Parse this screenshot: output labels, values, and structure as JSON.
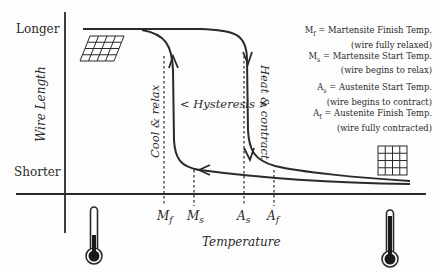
{
  "diagram": {
    "type": "hysteresis-curve",
    "y_axis": {
      "label": "Wire Length",
      "top_label": "Longer",
      "bottom_label": "Shorter"
    },
    "x_axis": {
      "label": "Temperature",
      "ticks": [
        {
          "symbol": "M",
          "sub": "f",
          "name": "Mf"
        },
        {
          "symbol": "M",
          "sub": "s",
          "name": "Ms"
        },
        {
          "symbol": "A",
          "sub": "s",
          "name": "As"
        },
        {
          "symbol": "A",
          "sub": "f",
          "name": "Af"
        }
      ]
    },
    "annotations": {
      "hysteresis": "< Hysteresis >",
      "cooling": "Cool & relax",
      "heating": "Heat & contract"
    },
    "legend": [
      {
        "symbol": "M",
        "sub": "f",
        "text": " = Martensite Finish Temp.",
        "note": "(wire fully relaxed)"
      },
      {
        "symbol": "M",
        "sub": "s",
        "text": " = Martensite Start Temp.",
        "note": "(wire begins to relax)"
      },
      {
        "symbol": "A",
        "sub": "s",
        "text": " = Austenite Start Temp.",
        "note": "(wire begins to contract)"
      },
      {
        "symbol": "A",
        "sub": "f",
        "text": " = Austenite Finish Temp.",
        "note": "(wire fully contracted)"
      }
    ],
    "icons": {
      "long_grid": "skewed-grid-icon",
      "short_grid": "square-grid-icon",
      "cold": "thermometer-low-icon",
      "hot": "thermometer-high-icon"
    },
    "colors": {
      "ink": "#2a2a2a",
      "background": "#fdfdfd"
    }
  }
}
